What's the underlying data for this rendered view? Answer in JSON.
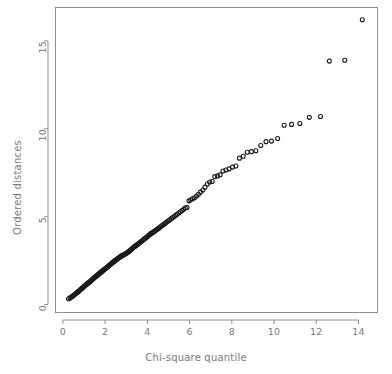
{
  "figure": {
    "background": "#ffffff",
    "panel_border_color": "#8e8e8e",
    "text_color": "#7a7a7a",
    "point_color": "#1a1a1a"
  },
  "chart_data": {
    "type": "scatter",
    "title": "",
    "xlabel": "Chi-square quantile",
    "ylabel": "Ordered distances",
    "xlim": [
      -0.35,
      14.9
    ],
    "ylim": [
      -0.45,
      16.9
    ],
    "xticks": [
      0,
      2,
      4,
      6,
      8,
      10,
      12,
      14
    ],
    "yticks": [
      0,
      5,
      10,
      15
    ],
    "xtick_labels": [
      "0",
      "2",
      "4",
      "6",
      "8",
      "10",
      "12",
      "14"
    ],
    "ytick_labels": [
      "0",
      "5",
      "10",
      "15"
    ],
    "grid": false,
    "legend": false,
    "marker": "open-circle",
    "marker_size": 4,
    "n_points": 160,
    "series": [
      {
        "name": "ordered distances vs chi-square quantiles",
        "x": [
          0.27,
          0.34,
          0.4,
          0.45,
          0.5,
          0.55,
          0.6,
          0.64,
          0.69,
          0.73,
          0.77,
          0.81,
          0.85,
          0.89,
          0.93,
          0.97,
          1.01,
          1.04,
          1.08,
          1.12,
          1.15,
          1.19,
          1.23,
          1.26,
          1.3,
          1.33,
          1.37,
          1.4,
          1.44,
          1.47,
          1.51,
          1.54,
          1.58,
          1.61,
          1.65,
          1.68,
          1.72,
          1.75,
          1.79,
          1.82,
          1.86,
          1.89,
          1.93,
          1.96,
          2.0,
          2.03,
          2.07,
          2.11,
          2.14,
          2.18,
          2.21,
          2.25,
          2.29,
          2.32,
          2.36,
          2.4,
          2.43,
          2.47,
          2.51,
          2.55,
          2.58,
          2.62,
          2.66,
          2.7,
          2.74,
          2.78,
          2.82,
          2.86,
          2.9,
          2.94,
          2.98,
          3.02,
          3.06,
          3.1,
          3.14,
          3.19,
          3.23,
          3.27,
          3.31,
          3.36,
          3.4,
          3.45,
          3.49,
          3.54,
          3.58,
          3.63,
          3.68,
          3.72,
          3.77,
          3.82,
          3.87,
          3.92,
          3.97,
          4.02,
          4.07,
          4.12,
          4.17,
          4.23,
          4.28,
          4.34,
          4.39,
          4.45,
          4.51,
          4.56,
          4.62,
          4.68,
          4.74,
          4.81,
          4.87,
          4.93,
          5.0,
          5.06,
          5.13,
          5.2,
          5.27,
          5.34,
          5.41,
          5.49,
          5.56,
          5.64,
          5.72,
          5.8,
          5.88,
          5.97,
          6.05,
          6.14,
          6.23,
          6.33,
          6.42,
          6.52,
          6.63,
          6.73,
          6.84,
          6.95,
          7.07,
          7.19,
          7.32,
          7.45,
          7.58,
          7.72,
          7.87,
          8.03,
          8.19,
          8.36,
          8.54,
          8.73,
          8.93,
          9.14,
          9.37,
          9.62,
          9.88,
          10.17,
          10.48,
          10.83,
          11.22,
          11.67,
          12.2,
          12.62,
          13.35,
          14.18
        ],
        "y": [
          0.33,
          0.38,
          0.43,
          0.47,
          0.52,
          0.57,
          0.62,
          0.66,
          0.7,
          0.74,
          0.79,
          0.83,
          0.87,
          0.92,
          0.96,
          1.0,
          1.04,
          1.07,
          1.11,
          1.15,
          1.18,
          1.22,
          1.26,
          1.29,
          1.33,
          1.36,
          1.4,
          1.44,
          1.48,
          1.51,
          1.55,
          1.58,
          1.62,
          1.65,
          1.69,
          1.72,
          1.76,
          1.79,
          1.83,
          1.86,
          1.9,
          1.93,
          1.97,
          2.0,
          2.04,
          2.07,
          2.11,
          2.14,
          2.18,
          2.21,
          2.25,
          2.29,
          2.32,
          2.36,
          2.4,
          2.43,
          2.47,
          2.5,
          2.54,
          2.57,
          2.61,
          2.64,
          2.68,
          2.71,
          2.74,
          2.77,
          2.8,
          2.82,
          2.85,
          2.88,
          2.9,
          2.93,
          2.96,
          3.0,
          3.04,
          3.09,
          3.13,
          3.18,
          3.22,
          3.27,
          3.31,
          3.35,
          3.39,
          3.43,
          3.47,
          3.52,
          3.56,
          3.6,
          3.65,
          3.7,
          3.75,
          3.79,
          3.84,
          3.89,
          3.94,
          3.99,
          4.05,
          4.08,
          4.12,
          4.17,
          4.22,
          4.27,
          4.32,
          4.37,
          4.43,
          4.48,
          4.54,
          4.59,
          4.65,
          4.71,
          4.77,
          4.83,
          4.89,
          4.95,
          5.01,
          5.08,
          5.14,
          5.21,
          5.28,
          5.35,
          5.42,
          5.5,
          5.52,
          5.9,
          5.96,
          6.02,
          6.08,
          6.18,
          6.28,
          6.4,
          6.52,
          6.68,
          6.86,
          6.97,
          7.0,
          7.28,
          7.32,
          7.38,
          7.6,
          7.66,
          7.72,
          7.82,
          7.88,
          8.33,
          8.44,
          8.67,
          8.7,
          8.75,
          9.05,
          9.27,
          9.3,
          9.45,
          10.2,
          10.25,
          10.3,
          10.65,
          10.7,
          13.85,
          13.9,
          16.2
        ]
      }
    ]
  }
}
